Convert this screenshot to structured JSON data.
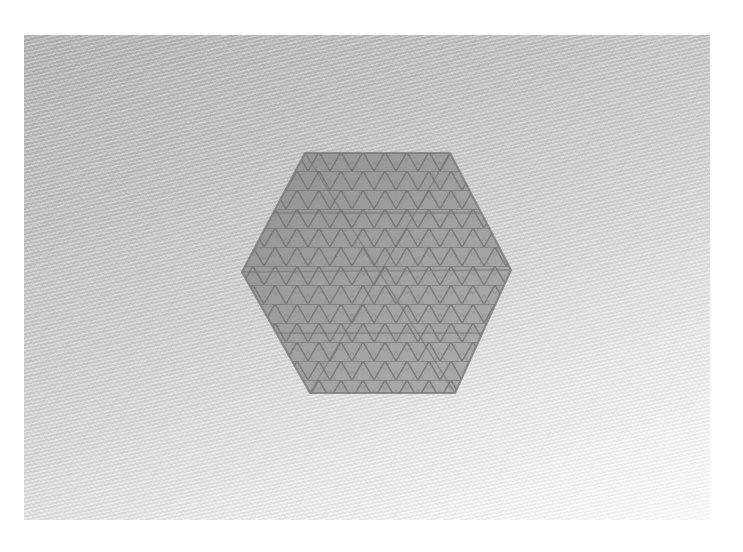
{
  "image": {
    "description": "Photograph of a hexagonal lattice mesh object resting on a white woven fabric surface",
    "subject": "hexagonal-lattice-mesh",
    "background": "woven-fabric",
    "colors": {
      "page_border": "#ffffff",
      "background_dark": "#b2b2b2",
      "background_light": "#ffffff",
      "mesh_fill": "#9a9a9a",
      "mesh_strut": "#7c7c7c"
    },
    "photo_frame": {
      "x": 24,
      "y": 35,
      "width": 686,
      "height": 485
    },
    "hexagon_vertices": [
      [
        305,
        153
      ],
      [
        450,
        153
      ],
      [
        511,
        270
      ],
      [
        455,
        393
      ],
      [
        310,
        393
      ],
      [
        242,
        272
      ]
    ]
  }
}
